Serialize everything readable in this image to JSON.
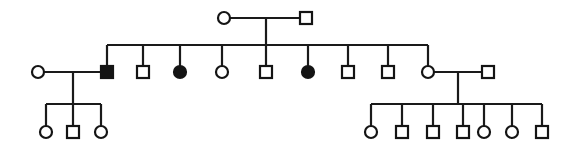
{
  "figure": {
    "kind": "pedigree",
    "width": 576,
    "height": 149,
    "background_color": "#ffffff",
    "line_color": "#1a1a1a",
    "symbol_stroke_color": "#141414",
    "affected_fill_color": "#141414",
    "unaffected_fill_color": "#ffffff"
  },
  "legend": {
    "square_meaning": "male",
    "circle_meaning": "female",
    "filled_meaning": "affected",
    "open_meaning": "unaffected"
  },
  "geometry": {
    "symbol_half_size": 6,
    "circle_radius": 6,
    "line_width": 2.2,
    "symbol_line_width": 2.2
  },
  "generations": [
    {
      "id": "I",
      "y": 18,
      "individuals": [
        {
          "id": "I-1",
          "sex": "female",
          "shape": "circle",
          "affected": false,
          "x": 224,
          "y": 18
        },
        {
          "id": "I-2",
          "sex": "male",
          "shape": "square",
          "affected": false,
          "x": 306,
          "y": 18
        }
      ]
    },
    {
      "id": "II",
      "y": 72,
      "individuals": [
        {
          "id": "II-0",
          "sex": "female",
          "shape": "circle",
          "affected": false,
          "x": 38,
          "y": 72,
          "role": "spouse-left"
        },
        {
          "id": "II-1",
          "sex": "male",
          "shape": "square",
          "affected": true,
          "x": 107,
          "y": 72,
          "role": "child"
        },
        {
          "id": "II-2",
          "sex": "male",
          "shape": "square",
          "affected": false,
          "x": 143,
          "y": 72,
          "role": "child"
        },
        {
          "id": "II-3",
          "sex": "female",
          "shape": "circle",
          "affected": true,
          "x": 180,
          "y": 72,
          "role": "child"
        },
        {
          "id": "II-4",
          "sex": "female",
          "shape": "circle",
          "affected": false,
          "x": 222,
          "y": 72,
          "role": "child"
        },
        {
          "id": "II-5",
          "sex": "male",
          "shape": "square",
          "affected": false,
          "x": 266,
          "y": 72,
          "role": "child"
        },
        {
          "id": "II-6",
          "sex": "female",
          "shape": "circle",
          "affected": true,
          "x": 308,
          "y": 72,
          "role": "child"
        },
        {
          "id": "II-7",
          "sex": "male",
          "shape": "square",
          "affected": false,
          "x": 348,
          "y": 72,
          "role": "child"
        },
        {
          "id": "II-8",
          "sex": "male",
          "shape": "square",
          "affected": false,
          "x": 388,
          "y": 72,
          "role": "child"
        },
        {
          "id": "II-9",
          "sex": "female",
          "shape": "circle",
          "affected": false,
          "x": 428,
          "y": 72,
          "role": "child"
        },
        {
          "id": "II-10",
          "sex": "male",
          "shape": "square",
          "affected": false,
          "x": 488,
          "y": 72,
          "role": "spouse-right"
        }
      ]
    },
    {
      "id": "III",
      "y": 132,
      "individuals": [
        {
          "id": "III-1",
          "sex": "female",
          "shape": "circle",
          "affected": false,
          "x": 46,
          "y": 132,
          "family": "left"
        },
        {
          "id": "III-2",
          "sex": "male",
          "shape": "square",
          "affected": false,
          "x": 73,
          "y": 132,
          "family": "left"
        },
        {
          "id": "III-3",
          "sex": "female",
          "shape": "circle",
          "affected": false,
          "x": 101,
          "y": 132,
          "family": "left"
        },
        {
          "id": "III-4",
          "sex": "female",
          "shape": "circle",
          "affected": false,
          "x": 371,
          "y": 132,
          "family": "right"
        },
        {
          "id": "III-5",
          "sex": "male",
          "shape": "square",
          "affected": false,
          "x": 402,
          "y": 132,
          "family": "right"
        },
        {
          "id": "III-6",
          "sex": "male",
          "shape": "square",
          "affected": false,
          "x": 433,
          "y": 132,
          "family": "right"
        },
        {
          "id": "III-7",
          "sex": "male",
          "shape": "square",
          "affected": false,
          "x": 463,
          "y": 132,
          "family": "right"
        },
        {
          "id": "III-8",
          "sex": "female",
          "shape": "circle",
          "affected": false,
          "x": 484,
          "y": 132,
          "family": "right"
        },
        {
          "id": "III-9",
          "sex": "female",
          "shape": "circle",
          "affected": false,
          "x": 512,
          "y": 132,
          "family": "right"
        },
        {
          "id": "III-10",
          "sex": "male",
          "shape": "square",
          "affected": false,
          "x": 542,
          "y": 132,
          "family": "right"
        }
      ]
    }
  ],
  "matings": [
    {
      "id": "mating-I",
      "partners": [
        "I-1",
        "I-2"
      ],
      "mating_line": {
        "x1": 230,
        "x2": 300,
        "y": 18
      },
      "descent_drop": {
        "x": 266,
        "y1": 18,
        "y2": 45
      },
      "sibship_line": {
        "x1": 107,
        "x2": 428,
        "y": 45
      },
      "children": [
        "II-1",
        "II-2",
        "II-3",
        "II-4",
        "II-5",
        "II-6",
        "II-7",
        "II-8",
        "II-9"
      ]
    },
    {
      "id": "mating-II-left",
      "partners": [
        "II-0",
        "II-1"
      ],
      "mating_line": {
        "x1": 44,
        "x2": 101,
        "y": 72
      },
      "descent_drop": {
        "x": 73,
        "y1": 72,
        "y2": 104
      },
      "sibship_line": {
        "x1": 46,
        "x2": 101,
        "y": 104
      },
      "children": [
        "III-1",
        "III-2",
        "III-3"
      ]
    },
    {
      "id": "mating-II-right",
      "partners": [
        "II-9",
        "II-10"
      ],
      "mating_line": {
        "x1": 434,
        "x2": 482,
        "y": 72
      },
      "descent_drop": {
        "x": 458,
        "y1": 72,
        "y2": 104
      },
      "sibship_line": {
        "x1": 371,
        "x2": 542,
        "y": 104
      },
      "children": [
        "III-4",
        "III-5",
        "III-6",
        "III-7",
        "III-8",
        "III-9",
        "III-10"
      ]
    }
  ],
  "counts": {
    "total_individuals": 23,
    "affected_individuals": 3,
    "generation_count": 3,
    "gen_I": 2,
    "gen_II": 11,
    "gen_III": 10
  }
}
